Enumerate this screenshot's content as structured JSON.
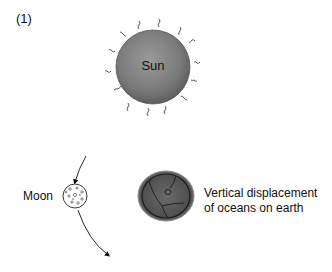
{
  "panel": {
    "label": "(1)"
  },
  "sun": {
    "label": "Sun",
    "color": "#7d7d7d"
  },
  "moon": {
    "label": "Moon"
  },
  "earth": {
    "label_line1": "Vertical displacement",
    "label_line2": "of oceans on earth",
    "color": "#5a5a5a"
  },
  "icons": {
    "sun": "sun-icon",
    "moon": "moon-icon",
    "earth": "earth-icon",
    "orbit": "orbit-arrow-icon"
  }
}
